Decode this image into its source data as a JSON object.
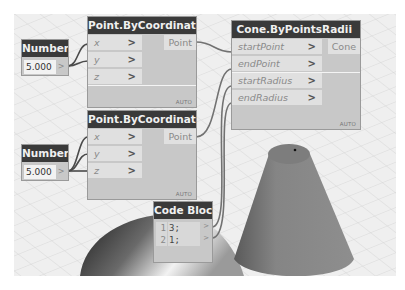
{
  "app": "Dynamo",
  "nodes": {
    "number1": {
      "title": "Number",
      "value": "5.000",
      "output": ">"
    },
    "number2": {
      "title": "Number",
      "value": "5.000",
      "output": ">"
    },
    "point1": {
      "title": "Point.ByCoordinates",
      "inputs": [
        {
          "name": "x",
          "chevron": ">"
        },
        {
          "name": "y",
          "chevron": ">"
        },
        {
          "name": "z",
          "chevron": ">"
        }
      ],
      "output": "Point",
      "lacing": "AUTO"
    },
    "point2": {
      "title": "Point.ByCoordinates",
      "inputs": [
        {
          "name": "x",
          "chevron": ">"
        },
        {
          "name": "y",
          "chevron": ">"
        },
        {
          "name": "z",
          "chevron": ">"
        }
      ],
      "output": "Point",
      "lacing": "AUTO"
    },
    "cone": {
      "title": "Cone.ByPointsRadii",
      "inputs": [
        {
          "name": "startPoint",
          "chevron": ">"
        },
        {
          "name": "endPoint",
          "chevron": ">"
        },
        {
          "name": "startRadius",
          "chevron": ">"
        },
        {
          "name": "endRadius",
          "chevron": ">"
        }
      ],
      "output": "Cone",
      "lacing": "AUTO"
    },
    "codeblock": {
      "title": "Code Block",
      "lines": [
        {
          "num": "1",
          "code": "3;",
          "output": ">"
        },
        {
          "num": "2",
          "code": "1;",
          "output": ">"
        }
      ]
    }
  },
  "colors": {
    "node_header": "#3a3a3a",
    "node_body": "#c8c8c8",
    "port_bg": "#e0e0e0",
    "wire": "#6e6e6e",
    "canvas": "#eeeeee",
    "cone_geometry": "#8a8a8a"
  }
}
